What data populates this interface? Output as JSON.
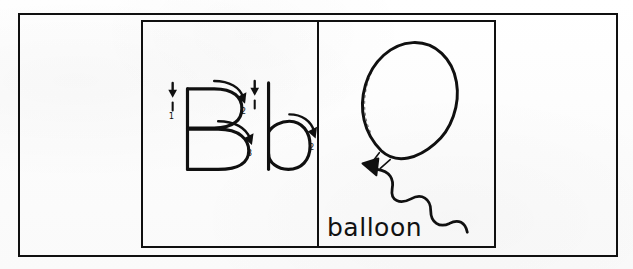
{
  "page": {
    "background_color": "#fdfdfd",
    "ink_color": "#101010"
  },
  "outer_frame": {
    "name": "outer border rectangle"
  },
  "inner_panel": {
    "name": "two-panel card",
    "divider": "vertical rule"
  },
  "letter_panel": {
    "uppercase_letter": "B",
    "lowercase_letter": "b",
    "stroke_numbers_uppercase": [
      "1",
      "2",
      "3"
    ],
    "stroke_numbers_lowercase": [
      "1",
      "2"
    ],
    "stroke_guides": [
      {
        "letter": "B",
        "index": "1",
        "label": "1",
        "type": "down-arrow"
      },
      {
        "letter": "B",
        "index": "2",
        "label": "2",
        "type": "curved-arrow"
      },
      {
        "letter": "B",
        "index": "3",
        "label": "3",
        "type": "curved-arrow"
      },
      {
        "letter": "b",
        "index": "1",
        "label": "1",
        "type": "down-arrow"
      },
      {
        "letter": "b",
        "index": "2",
        "label": "2",
        "type": "curved-arrow"
      }
    ]
  },
  "picture_panel": {
    "word": "balloon",
    "illustration": "balloon with wavy string"
  }
}
